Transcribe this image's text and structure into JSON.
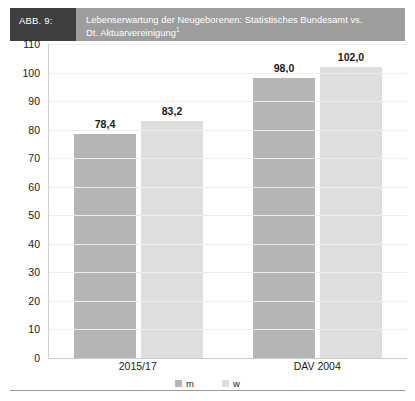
{
  "header": {
    "tag": "ABB. 9:",
    "title_line1": "Lebenserwartung der Neugeborenen: Statistisches Bundesamt vs.",
    "title_line2": "Dt. Aktuarvereinigung",
    "title_superscript": "1",
    "tag_bg": "#3f3f3f",
    "title_bg": "#9d9d9d"
  },
  "legend": {
    "items": [
      {
        "label": "m",
        "color": "#b5b5b5"
      },
      {
        "label": "w",
        "color": "#dedede"
      }
    ]
  },
  "chart_data": {
    "type": "bar",
    "title": "Lebenserwartung der Neugeborenen: Statistisches Bundesamt vs. Dt. Aktuarvereinigung",
    "xlabel": "",
    "ylabel": "",
    "categories": [
      "2015/17",
      "DAV 2004"
    ],
    "series": [
      {
        "name": "m",
        "color": "#b5b5b5",
        "values": [
          78.4,
          98.0
        ],
        "labels": [
          "78,4",
          "98,0"
        ]
      },
      {
        "name": "w",
        "color": "#dedede",
        "values": [
          83.2,
          102.0
        ],
        "labels": [
          "83,2",
          "102,0"
        ]
      }
    ],
    "ylim": [
      0,
      110
    ],
    "ytick_step": 10,
    "yticks": [
      110,
      100,
      90,
      80,
      70,
      60,
      50,
      40,
      30,
      20,
      10,
      0
    ],
    "ytick_labels": [
      "110",
      "100",
      "90",
      "80",
      "70",
      "60",
      "50",
      "40",
      "30",
      "20",
      "10",
      "0"
    ],
    "grid": true,
    "legend_position": "bottom"
  }
}
